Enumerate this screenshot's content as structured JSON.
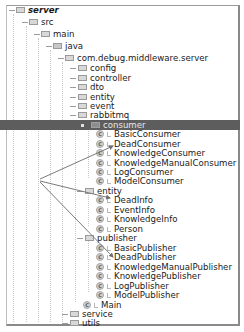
{
  "tree": {
    "root": {
      "label": "server"
    },
    "src": {
      "label": "src"
    },
    "main": {
      "label": "main"
    },
    "java": {
      "label": "java"
    },
    "package": {
      "label": "com.debug.middleware.server"
    },
    "folders_top": [
      {
        "label": "config"
      },
      {
        "label": "controller"
      },
      {
        "label": "dto"
      },
      {
        "label": "entity"
      },
      {
        "label": "event"
      },
      {
        "label": "rabbitmq"
      }
    ],
    "consumer": {
      "label": "consumer",
      "selected": true,
      "classes": [
        {
          "label": "BasicConsumer"
        },
        {
          "label": "DeadConsumer"
        },
        {
          "label": "KnowledgeConsumer"
        },
        {
          "label": "KnowledgeManualConsumer"
        },
        {
          "label": "LogConsumer"
        },
        {
          "label": "ModelConsumer"
        }
      ]
    },
    "entity": {
      "label": "entity",
      "classes": [
        {
          "label": "DeadInfo"
        },
        {
          "label": "EventInfo"
        },
        {
          "label": "KnowledgeInfo"
        },
        {
          "label": "Person"
        }
      ]
    },
    "publisher": {
      "label": "publisher",
      "classes": [
        {
          "label": "BasicPublisher"
        },
        {
          "label": "DeadPublisher"
        },
        {
          "label": "KnowledgeManualPublisher"
        },
        {
          "label": "KnowledgePublisher"
        },
        {
          "label": "LogPublisher"
        },
        {
          "label": "ModelPublisher"
        }
      ]
    },
    "main_class": {
      "label": "Main"
    },
    "folders_bottom": [
      {
        "label": "service"
      },
      {
        "label": "utils"
      }
    ],
    "class_icon_glyph": "C"
  },
  "annotations": {
    "arrow_origin": [
      40,
      179
    ],
    "arrow_targets": [
      "DeadConsumer",
      "DeadInfo",
      "DeadPublisher"
    ],
    "arrow_color": "#7a7a7a"
  },
  "colors": {
    "selection_bg": "#5d5d5d",
    "selection_text": "#e8e8e8",
    "frame": "#8a8a8a"
  }
}
